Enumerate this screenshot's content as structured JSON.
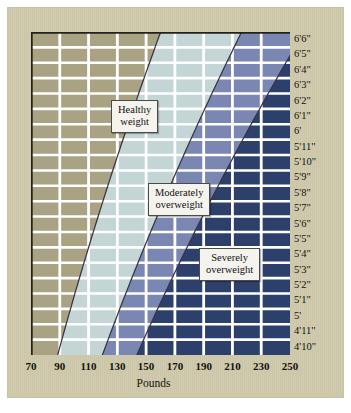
{
  "chart_data": {
    "type": "area",
    "title": "",
    "subtitle": "",
    "xlabel": "Pounds",
    "ylabel": "",
    "xlim": [
      70,
      250
    ],
    "ylim_labels": [
      "4'10\"",
      "6'6\""
    ],
    "grid": true,
    "legend_position": "inline-callouts",
    "x_ticks": [
      70,
      90,
      110,
      130,
      150,
      170,
      190,
      210,
      230,
      250
    ],
    "x_tick_labels": [
      "70",
      "90",
      "110",
      "130",
      "150",
      "170",
      "190",
      "210",
      "230",
      "250"
    ],
    "y_tick_labels": [
      "6'6\"",
      "6'5\"",
      "6'4\"",
      "6'3\"",
      "6'2\"",
      "6'1\"",
      "6'",
      "5'11\"",
      "5'10\"",
      "5'9\"",
      "5'8\"",
      "5'7\"",
      "5'6\"",
      "5'5\"",
      "5'4\"",
      "5'3\"",
      "5'2\"",
      "5'1\"",
      "5'",
      "4'11\"",
      "4'10\""
    ],
    "heights_inches": [
      78,
      77,
      76,
      75,
      74,
      73,
      72,
      71,
      70,
      69,
      68,
      67,
      66,
      65,
      64,
      63,
      62,
      61,
      60,
      59,
      58
    ],
    "bands": [
      {
        "name": "Underweight",
        "color": "#a9a283",
        "label_shown": false,
        "bmi_range": [
          0,
          18.5
        ]
      },
      {
        "name": "Healthy weight",
        "color": "#c3d5d5",
        "label_shown": true,
        "bmi_range": [
          18.5,
          25
        ]
      },
      {
        "name": "Moderately overweight",
        "color": "#7b87b3",
        "label_shown": true,
        "bmi_range": [
          25,
          30
        ]
      },
      {
        "name": "Severely overweight",
        "color": "#2d3f6b",
        "label_shown": true,
        "bmi_range": [
          30,
          100
        ]
      }
    ],
    "boundary_curves": [
      {
        "name": "BMI 18.5 (underweight / healthy)",
        "bmi": 18.5,
        "points_lbs_by_height": [
          {
            "height": "6'6\"",
            "lbs": 156
          },
          {
            "height": "6'0\"",
            "lbs": 136
          },
          {
            "height": "5'6\"",
            "lbs": 115
          },
          {
            "height": "5'0\"",
            "lbs": 95
          },
          {
            "height": "4'10\"",
            "lbs": 88
          }
        ]
      },
      {
        "name": "BMI 25 (healthy / moderately overweight)",
        "bmi": 25,
        "points_lbs_by_height": [
          {
            "height": "6'6\"",
            "lbs": 211
          },
          {
            "height": "6'0\"",
            "lbs": 184
          },
          {
            "height": "5'6\"",
            "lbs": 155
          },
          {
            "height": "5'0\"",
            "lbs": 128
          },
          {
            "height": "4'10\"",
            "lbs": 119
          }
        ]
      },
      {
        "name": "BMI 30 (moderately / severely overweight)",
        "bmi": 30,
        "points_lbs_by_height": [
          {
            "height": "6'6\"",
            "lbs": 253
          },
          {
            "height": "6'0\"",
            "lbs": 221
          },
          {
            "height": "5'6\"",
            "lbs": 186
          },
          {
            "height": "5'0\"",
            "lbs": 154
          },
          {
            "height": "4'10\"",
            "lbs": 143
          }
        ]
      }
    ],
    "annotations": [
      {
        "text": "Healthy weight",
        "line1": "Healthy",
        "line2": "weight"
      },
      {
        "text": "Moderately overweight",
        "line1": "Moderately",
        "line2": "overweight"
      },
      {
        "text": "Severely overweight",
        "line1": "Severely",
        "line2": "overweight"
      }
    ]
  },
  "axis": {
    "x_title": "Pounds"
  },
  "callouts": {
    "healthy": {
      "line1": "Healthy",
      "line2": "weight"
    },
    "moderate": {
      "line1": "Moderately",
      "line2": "overweight"
    },
    "severe": {
      "line1": "Severely",
      "line2": "overweight"
    }
  },
  "colors": {
    "mat": "#cec8aa",
    "underweight": "#a9a283",
    "healthy": "#c3d5d5",
    "moderate": "#7b87b3",
    "severe": "#2d3f6b",
    "gridline": "#ffffff",
    "axis_line": "#23211a",
    "curve_line": "#3a3346",
    "text": "#14120c",
    "callout_bg": "#f4f3ee",
    "callout_border": "#4a4a4a"
  }
}
